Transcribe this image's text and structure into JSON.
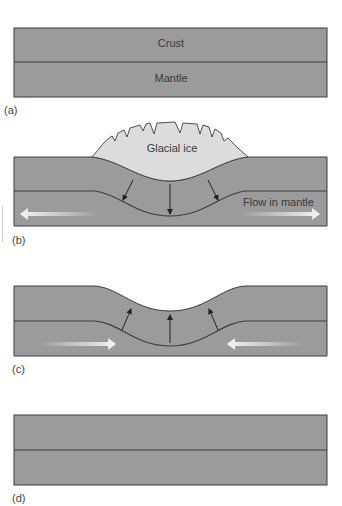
{
  "colors": {
    "rock": "#9b9b9b",
    "boundary": "#3c3c3c",
    "ice": "#dcdcdc",
    "background": "#ffffff",
    "flow_arrow": "#f2f2f2"
  },
  "panels": [
    {
      "id": "a",
      "label": "(a)",
      "layers": {
        "top": "Crust",
        "bottom": "Mantle"
      }
    },
    {
      "id": "b",
      "label": "(b)",
      "ice_label": "Glacial ice",
      "flow_label": "Flow in mantle",
      "arrows": {
        "small": "downward (pressure from ice)",
        "flow": "outward in mantle"
      }
    },
    {
      "id": "c",
      "label": "(c)",
      "arrows": {
        "small": "upward (rebound)",
        "flow": "inward in mantle"
      }
    },
    {
      "id": "d",
      "label": "(d)"
    }
  ]
}
